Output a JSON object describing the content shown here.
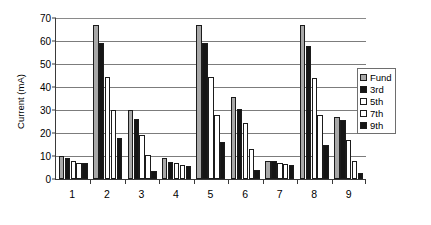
{
  "chart_data": {
    "type": "bar",
    "title": "",
    "subtitle": "",
    "xlabel": "",
    "ylabel": "Current (mA)",
    "ylim": [
      0,
      70
    ],
    "ytick_step": 10,
    "yticks": [
      0,
      10,
      20,
      30,
      40,
      50,
      60,
      70
    ],
    "ytick_labels": [
      "0",
      "10",
      "20",
      "30",
      "40",
      "50",
      "60",
      "70"
    ],
    "categories": [
      "1",
      "2",
      "3",
      "4",
      "5",
      "6",
      "7",
      "8",
      "9"
    ],
    "grid": true,
    "grid_axis": "y",
    "legend_position": "right",
    "series": [
      {
        "name": "Fund",
        "color": "#a8a8a8",
        "fill": "solid-gray",
        "values": [
          10,
          67,
          30,
          9,
          67,
          35.5,
          8,
          67,
          27
        ]
      },
      {
        "name": "3rd",
        "color": "#151515",
        "fill": "solid-black",
        "values": [
          9,
          59,
          26,
          7.5,
          59,
          30.5,
          8,
          58,
          25.5
        ]
      },
      {
        "name": "5th",
        "color": "#ffffff",
        "fill": "white",
        "values": [
          8,
          44.5,
          19,
          7,
          44.5,
          24.5,
          7,
          44,
          17
        ]
      },
      {
        "name": "7th",
        "color": "#ffffff",
        "fill": "white",
        "values": [
          7,
          30,
          10.5,
          6,
          28,
          13,
          6.5,
          28,
          8
        ]
      },
      {
        "name": "9th",
        "color": "#151515",
        "fill": "solid-black",
        "values": [
          7,
          18,
          3.5,
          5.5,
          16,
          4,
          6,
          15,
          2.5
        ]
      }
    ]
  },
  "legend": {
    "items": [
      {
        "label": "Fund"
      },
      {
        "label": "3rd"
      },
      {
        "label": "5th"
      },
      {
        "label": "7th"
      },
      {
        "label": "9th"
      }
    ]
  }
}
